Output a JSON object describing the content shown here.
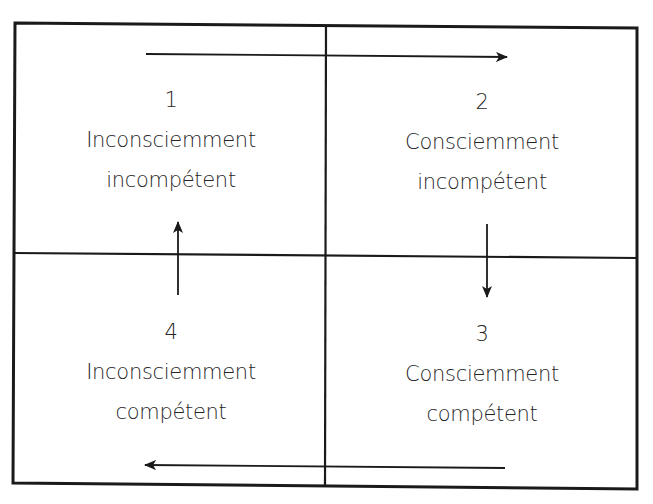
{
  "diagram": {
    "type": "competence-matrix-2x2",
    "quadrants": [
      {
        "id": "q1",
        "number": "1",
        "line1": "Inconsciemment",
        "line2": "incompétent",
        "position": "top-left"
      },
      {
        "id": "q2",
        "number": "2",
        "line1": "Consciemment",
        "line2": "incompétent",
        "position": "top-right"
      },
      {
        "id": "q3",
        "number": "3",
        "line1": "Consciemment",
        "line2": "compétent",
        "position": "bottom-right"
      },
      {
        "id": "q4",
        "number": "4",
        "line1": "Inconsciemment",
        "line2": "compétent",
        "position": "bottom-left"
      }
    ],
    "arrows": [
      {
        "from": "1",
        "to": "2",
        "direction": "right"
      },
      {
        "from": "2",
        "to": "3",
        "direction": "down"
      },
      {
        "from": "3",
        "to": "4",
        "direction": "left"
      },
      {
        "from": "4",
        "to": "1",
        "direction": "up"
      }
    ],
    "colors": {
      "line": "#1a1a1a",
      "text": "#262626",
      "background": "#ffffff"
    }
  }
}
